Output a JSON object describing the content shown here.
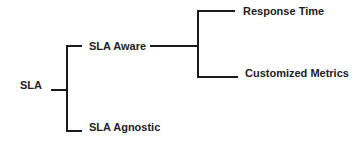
{
  "diagram": {
    "type": "tree",
    "root": {
      "label": "SLA",
      "children": [
        {
          "label": "SLA Aware",
          "children": [
            {
              "label": "Response Time"
            },
            {
              "label": "Customized Metrics"
            }
          ]
        },
        {
          "label": "SLA Agnostic"
        }
      ]
    },
    "colors": {
      "line": "#1a1a1a",
      "text": "#222222",
      "background": "#ffffff"
    }
  }
}
